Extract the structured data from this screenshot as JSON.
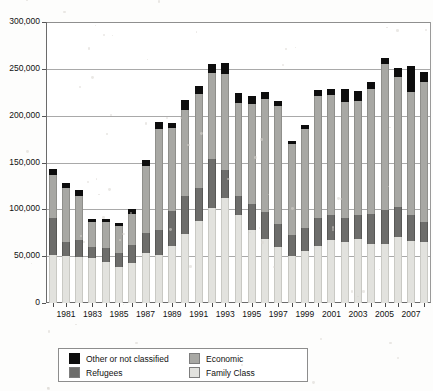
{
  "chart_data": {
    "type": "bar",
    "subtype": "stacked-bar",
    "title": "",
    "xlabel": "",
    "ylabel": "",
    "ylim": [
      0,
      300000
    ],
    "ytick_values": [
      0,
      50000,
      100000,
      150000,
      200000,
      250000,
      300000
    ],
    "ytick_labels": [
      "0",
      "50,000",
      "100,000",
      "150,000",
      "200,000",
      "250,000",
      "300,000"
    ],
    "grid": true,
    "grid_axis": "y",
    "legend_position": "bottom",
    "categories": [
      "1980",
      "1981",
      "1982",
      "1983",
      "1984",
      "1985",
      "1986",
      "1987",
      "1988",
      "1989",
      "1990",
      "1991",
      "1992",
      "1993",
      "1994",
      "1995",
      "1996",
      "1997",
      "1998",
      "1999",
      "2000",
      "2001",
      "2002",
      "2003",
      "2004",
      "2005",
      "2006",
      "2007",
      "2008"
    ],
    "xtick_labels": [
      "1981",
      "1983",
      "1985",
      "1987",
      "1989",
      "1991",
      "1993",
      "1995",
      "1997",
      "1999",
      "2001",
      "2003",
      "2005",
      "2007"
    ],
    "series": [
      {
        "name": "Family Class",
        "color": "#e2e2de",
        "values": [
          51000,
          50500,
          49500,
          48500,
          43500,
          38500,
          42500,
          53500,
          51500,
          60500,
          74000,
          87500,
          101000,
          112000,
          94000,
          77500,
          68500,
          60000,
          50500,
          55500,
          60500,
          67000,
          65000,
          68500,
          62500,
          63500,
          70500,
          66500,
          65500
        ]
      },
      {
        "name": "Refugees",
        "color": "#6d6d6b",
        "values": [
          40000,
          15000,
          17500,
          11500,
          15500,
          14500,
          19000,
          21500,
          26500,
          37500,
          40000,
          35500,
          52500,
          30000,
          20000,
          28000,
          28500,
          24000,
          22500,
          24500,
          30500,
          27500,
          25500,
          25500,
          32500,
          35500,
          32500,
          27500,
          21500
        ]
      },
      {
        "name": "Economic",
        "color": "#a8a8a4",
        "values": [
          46000,
          57500,
          47500,
          26000,
          27500,
          29500,
          34000,
          71500,
          108000,
          88500,
          92500,
          100500,
          92500,
          102500,
          99500,
          106500,
          120500,
          126000,
          96500,
          106000,
          130000,
          127500,
          124000,
          121500,
          133500,
          156500,
          138500,
          131500,
          149500
        ]
      },
      {
        "name": "Other or not classified",
        "color": "#0d0d0d",
        "values": [
          6000,
          5500,
          6000,
          3500,
          3000,
          3000,
          5000,
          6000,
          7500,
          5500,
          10000,
          8500,
          9000,
          11500,
          10500,
          9000,
          8000,
          6000,
          4000,
          4000,
          6000,
          6500,
          14000,
          11000,
          7500,
          6500,
          9500,
          27500,
          10500
        ]
      }
    ],
    "legend_entries": [
      {
        "label": "Other or not classified",
        "color": "#0d0d0d"
      },
      {
        "label": "Economic",
        "color": "#a8a8a4"
      },
      {
        "label": "Refugees",
        "color": "#6d6d6b"
      },
      {
        "label": "Family Class",
        "color": "#e2e2de"
      }
    ]
  }
}
